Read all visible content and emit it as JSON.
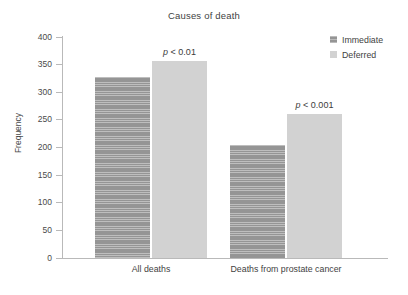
{
  "chart_data": {
    "type": "bar",
    "title": "Causes of death",
    "xlabel": "",
    "ylabel": "Frequency",
    "ylim": [
      0,
      400
    ],
    "yticks": [
      0,
      50,
      100,
      150,
      200,
      250,
      300,
      350,
      400
    ],
    "ytick_labels": [
      "0",
      "50",
      "100",
      "150",
      "200",
      "250",
      "300",
      "350",
      "400"
    ],
    "grid": false,
    "legend_position": "top-right",
    "categories": [
      "All deaths",
      "Deaths from prostate cancer"
    ],
    "series": [
      {
        "name": "Immediate",
        "color": "#9d9d9d",
        "pattern": "horizontal-stripes",
        "values": [
          327,
          205
        ]
      },
      {
        "name": "Deferred",
        "color": "#d2d2d2",
        "pattern": "solid",
        "values": [
          357,
          260
        ]
      }
    ],
    "annotations": [
      {
        "id": "p-annotation-all-deaths",
        "variable": "p",
        "text": " < 0.01",
        "full_text": "p < 0.01",
        "attached_to_category": "All deaths",
        "attached_to_series": "Deferred"
      },
      {
        "id": "p-annotation-prostate-cancer",
        "variable": "p",
        "text": " < 0.001",
        "full_text": "p < 0.001",
        "attached_to_category": "Deaths from prostate cancer",
        "attached_to_series": "Deferred"
      }
    ]
  },
  "legend": {
    "items": [
      {
        "label": "Immediate"
      },
      {
        "label": "Deferred"
      }
    ]
  }
}
